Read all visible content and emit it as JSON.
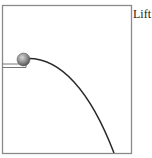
{
  "diagram": {
    "label": "Lift",
    "colors": {
      "frame": "#8a8a8a",
      "trajectory": "#2a2a2a",
      "ball": "#8c8c8c",
      "platform": "#777777"
    },
    "elements": [
      {
        "type": "frame"
      },
      {
        "type": "launch-platform"
      },
      {
        "type": "ball"
      },
      {
        "type": "trajectory-curve"
      }
    ]
  }
}
